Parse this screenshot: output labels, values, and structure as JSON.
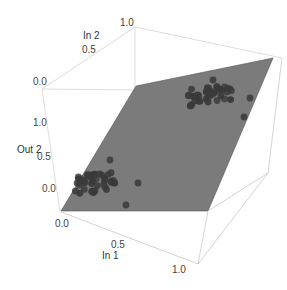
{
  "chart_data": {
    "type": "scatter3d",
    "title": "",
    "axes": {
      "x": {
        "label": "In 1",
        "ticks": [
          "0.0",
          "0.5",
          "1.0"
        ],
        "range": [
          0,
          1
        ]
      },
      "y": {
        "label": "In 2",
        "ticks": [
          "0.0",
          "0.5",
          "1.0"
        ],
        "range": [
          0,
          1
        ]
      },
      "z": {
        "label": "Out 2",
        "ticks": [
          "0.0",
          "0.5",
          "1.0"
        ],
        "range": [
          -0.2,
          1.3
        ]
      }
    },
    "surface": {
      "type": "plane",
      "color": "#7a7a7a",
      "description": "fitted plane Out2 ≈ In2"
    },
    "series": [
      {
        "name": "cluster-low",
        "color": "#3a3a3a",
        "approx_center": {
          "in1": 0.3,
          "in2": 0.05,
          "out2": 0.05
        },
        "count": 40
      },
      {
        "name": "cluster-high",
        "color": "#3a3a3a",
        "approx_center": {
          "in1": 0.3,
          "in2": 0.95,
          "out2": 0.95
        },
        "count": 40
      }
    ],
    "grid": false,
    "legend": "none"
  },
  "labels": {
    "in2": "In 2",
    "in1": "In 1",
    "out2": "Out 2",
    "in2_t0": "0.0",
    "in2_t05": "0.5",
    "in2_t1": "1.0",
    "out2_t0": "0.0",
    "out2_t05": "0.5",
    "out2_t1": "1.0",
    "in1_t0": "0.0",
    "in1_t05": "0.5",
    "in1_t1": "1.0"
  }
}
